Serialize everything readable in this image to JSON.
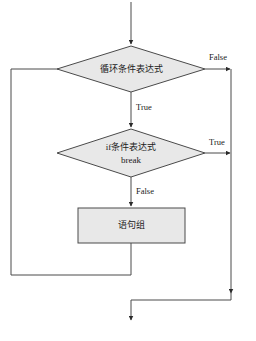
{
  "diagram": {
    "colors": {
      "shape_fill": "#e8e8e8",
      "stroke": "#4a4a4a",
      "text": "#1a1a1a",
      "background": "#ffffff"
    },
    "nodes": [
      {
        "id": "loop-condition",
        "type": "decision",
        "label": "循环条件表达式",
        "lines": [
          "循环条件表达式"
        ]
      },
      {
        "id": "if-condition",
        "type": "decision",
        "label": "if条件表达式 break",
        "lines": [
          "if条件表达式",
          "break"
        ]
      },
      {
        "id": "statement-group",
        "type": "process",
        "label": "语句组",
        "lines": [
          "语句组"
        ]
      }
    ],
    "edge_labels": {
      "loop_false": "False",
      "loop_true": "True",
      "if_true": "True",
      "if_false": "False"
    }
  }
}
